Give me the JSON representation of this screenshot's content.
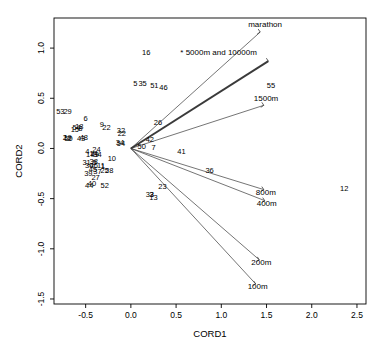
{
  "chart_data": {
    "type": "scatter",
    "title": "",
    "xlabel": "CORD1",
    "ylabel": "CORD2",
    "xlim": [
      -0.85,
      2.6
    ],
    "ylim": [
      -1.55,
      1.3
    ],
    "xticks": [
      "-0.5",
      "0.0",
      "0.5",
      "1.0",
      "1.5",
      "2.0",
      "2.5"
    ],
    "xtickvals": [
      -0.5,
      0.0,
      0.5,
      1.0,
      1.5,
      2.0,
      2.5
    ],
    "yticks": [
      "-1.5",
      "-1.0",
      "-0.5",
      "0.0",
      "0.5",
      "1.0"
    ],
    "ytickvals": [
      -1.5,
      -1.0,
      -0.5,
      0.0,
      0.5,
      1.0
    ],
    "grid": false,
    "legend": "none",
    "annotation": "* 5000m and 10000m",
    "points": [
      {
        "label": "53",
        "x": -0.78,
        "y": 0.36
      },
      {
        "label": "29",
        "x": -0.7,
        "y": 0.36
      },
      {
        "label": "6",
        "x": -0.5,
        "y": 0.29
      },
      {
        "label": "15",
        "x": -0.62,
        "y": 0.18
      },
      {
        "label": "54",
        "x": -0.6,
        "y": 0.2
      },
      {
        "label": "18",
        "x": -0.57,
        "y": 0.21
      },
      {
        "label": "8",
        "x": -0.56,
        "y": 0.19
      },
      {
        "label": "9",
        "x": -0.32,
        "y": 0.23
      },
      {
        "label": "22",
        "x": -0.27,
        "y": 0.2
      },
      {
        "label": "2",
        "x": -0.73,
        "y": 0.1
      },
      {
        "label": "19",
        "x": -0.7,
        "y": 0.1
      },
      {
        "label": "50",
        "x": -0.69,
        "y": 0.09
      },
      {
        "label": "2b",
        "x": -0.68,
        "y": 0.09
      },
      {
        "label": "43",
        "x": -0.55,
        "y": 0.09
      },
      {
        "label": "48",
        "x": -0.52,
        "y": 0.1
      },
      {
        "label": "32",
        "x": -0.11,
        "y": 0.17
      },
      {
        "label": "22b",
        "x": -0.1,
        "y": 0.14
      },
      {
        "label": "34",
        "x": -0.12,
        "y": 0.05
      },
      {
        "label": "54b",
        "x": -0.11,
        "y": 0.04
      },
      {
        "label": "4",
        "x": -0.48,
        "y": -0.04
      },
      {
        "label": "24",
        "x": -0.38,
        "y": -0.02
      },
      {
        "label": "17",
        "x": -0.45,
        "y": -0.07
      },
      {
        "label": "14",
        "x": -0.41,
        "y": -0.06
      },
      {
        "label": "49",
        "x": -0.4,
        "y": -0.07
      },
      {
        "label": "34b",
        "x": -0.37,
        "y": -0.07
      },
      {
        "label": "31",
        "x": -0.49,
        "y": -0.14
      },
      {
        "label": "38",
        "x": -0.41,
        "y": -0.13
      },
      {
        "label": "5b",
        "x": -0.4,
        "y": -0.14
      },
      {
        "label": "30",
        "x": -0.46,
        "y": -0.17
      },
      {
        "label": "46",
        "x": -0.41,
        "y": -0.17
      },
      {
        "label": "11",
        "x": -0.33,
        "y": -0.17
      },
      {
        "label": "1",
        "x": -0.31,
        "y": -0.18
      },
      {
        "label": "10",
        "x": -0.21,
        "y": -0.11
      },
      {
        "label": "45",
        "x": -0.42,
        "y": -0.21
      },
      {
        "label": "37",
        "x": -0.37,
        "y": -0.23
      },
      {
        "label": "25",
        "x": -0.29,
        "y": -0.22
      },
      {
        "label": "28",
        "x": -0.24,
        "y": -0.22
      },
      {
        "label": "39",
        "x": -0.47,
        "y": -0.25
      },
      {
        "label": "27",
        "x": -0.39,
        "y": -0.29
      },
      {
        "label": "44",
        "x": -0.46,
        "y": -0.37
      },
      {
        "label": "40",
        "x": -0.43,
        "y": -0.35
      },
      {
        "label": "52",
        "x": -0.29,
        "y": -0.37
      },
      {
        "label": "16",
        "x": 0.17,
        "y": 0.95
      },
      {
        "label": "5",
        "x": 0.05,
        "y": 0.64
      },
      {
        "label": "35",
        "x": 0.13,
        "y": 0.64
      },
      {
        "label": "51",
        "x": 0.26,
        "y": 0.62
      },
      {
        "label": "46b",
        "x": 0.36,
        "y": 0.6
      },
      {
        "label": "26",
        "x": 0.3,
        "y": 0.25
      },
      {
        "label": "42",
        "x": 0.21,
        "y": 0.08
      },
      {
        "label": "50b",
        "x": 0.12,
        "y": 0.01
      },
      {
        "label": "7",
        "x": 0.25,
        "y": 0.0
      },
      {
        "label": "41",
        "x": 0.56,
        "y": -0.04
      },
      {
        "label": "36",
        "x": 0.87,
        "y": -0.22
      },
      {
        "label": "23",
        "x": 0.35,
        "y": -0.38
      },
      {
        "label": "33",
        "x": 0.21,
        "y": -0.46
      },
      {
        "label": "3",
        "x": 0.23,
        "y": -0.46
      },
      {
        "label": "13",
        "x": 0.25,
        "y": -0.49
      },
      {
        "label": "55",
        "x": 1.55,
        "y": 0.62
      },
      {
        "label": "12",
        "x": 2.36,
        "y": -0.4
      }
    ],
    "vectors": [
      {
        "label": "marathon",
        "x": 1.43,
        "y": 1.16
      },
      {
        "label": "* 5000m and 10000m",
        "x": 1.52,
        "y": 0.87
      },
      {
        "label": "1500m",
        "x": 1.47,
        "y": 0.43
      },
      {
        "label": "800m",
        "x": 1.47,
        "y": -0.41
      },
      {
        "label": "400m",
        "x": 1.48,
        "y": -0.52
      },
      {
        "label": "200m",
        "x": 1.42,
        "y": -1.11
      },
      {
        "label": "100m",
        "x": 1.38,
        "y": -1.35
      }
    ],
    "origin": {
      "x": 0.0,
      "y": 0.0
    },
    "colors": {
      "axis": "#000000",
      "point": "#000000",
      "vector": "#3a3a3a"
    }
  }
}
